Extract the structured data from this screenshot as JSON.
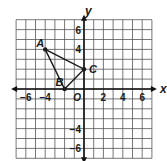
{
  "diagram": {
    "type": "coordinate-plane",
    "x_axis": {
      "label": "x",
      "min": -7,
      "max": 7,
      "ticks": [
        -6,
        -4,
        2,
        4,
        6
      ]
    },
    "y_axis": {
      "label": "y",
      "min": -7,
      "max": 7,
      "ticks": [
        6,
        4,
        -4,
        -6
      ]
    },
    "origin_label": "O",
    "grid": {
      "step": 1,
      "color": "#555555"
    },
    "triangle": {
      "points": [
        {
          "name": "A",
          "x": -4,
          "y": 4
        },
        {
          "name": "B",
          "x": -2,
          "y": 0
        },
        {
          "name": "C",
          "x": 0,
          "y": 2
        }
      ],
      "color": "#1a1a1a"
    }
  }
}
